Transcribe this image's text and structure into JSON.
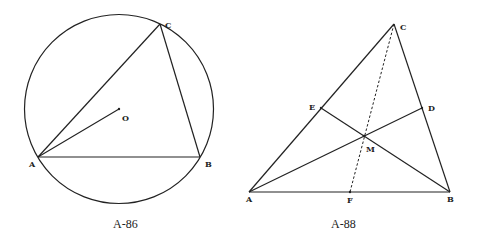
{
  "figures": [
    {
      "caption": "A-86",
      "labels": {
        "A": "A",
        "B": "B",
        "C": "C",
        "O": "O"
      }
    },
    {
      "caption": "A-88",
      "labels": {
        "A": "A",
        "B": "B",
        "C": "C",
        "D": "D",
        "E": "E",
        "F": "F",
        "M": "M"
      }
    }
  ],
  "colors": {
    "line": "#222222",
    "background": "#ffffff"
  }
}
